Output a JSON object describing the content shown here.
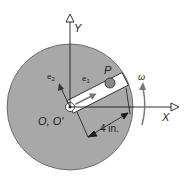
{
  "diagram": {
    "labels": {
      "y_axis": "Y",
      "x_axis": "X",
      "origin": "O, O'",
      "point": "P",
      "e1": "e",
      "e1_sub": "1",
      "e2": "e",
      "e2_sub": "2",
      "omega": "ω",
      "dimension": "4 in."
    },
    "colors": {
      "disk": "#a8a8a8",
      "line": "#1a1a1a",
      "slot": "#ffffff",
      "ball": "#8a8a8a",
      "omega_arrow": "#777777"
    }
  }
}
